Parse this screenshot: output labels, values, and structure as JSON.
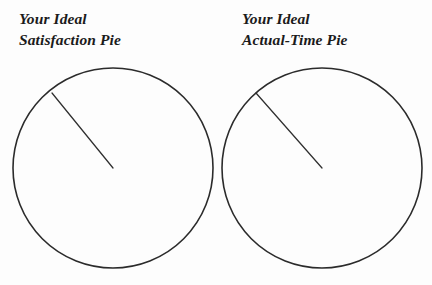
{
  "page": {
    "background_color": "#fdfdfd",
    "ink_color": "#2b2b2b",
    "width": 432,
    "height": 285
  },
  "panels": [
    {
      "id": "satisfaction",
      "title_line1": "Your Ideal",
      "title_line2": "Satisfaction Pie",
      "circle": {
        "center_x": 113,
        "center_y": 168,
        "radius": 100,
        "stroke_color": "#2b2b2b"
      },
      "radius_line": {
        "from_x": 113,
        "from_y": 168,
        "to_x": 52,
        "to_y": 93,
        "stroke_color": "#2f2f2f"
      }
    },
    {
      "id": "actual-time",
      "title_line1": "Your Ideal",
      "title_line2": "Actual-Time Pie",
      "circle": {
        "center_x": 106,
        "center_y": 168,
        "radius": 100,
        "stroke_color": "#2b2b2b"
      },
      "radius_line": {
        "from_x": 106,
        "from_y": 168,
        "to_x": 40,
        "to_y": 93,
        "stroke_color": "#2f2f2f"
      }
    }
  ]
}
